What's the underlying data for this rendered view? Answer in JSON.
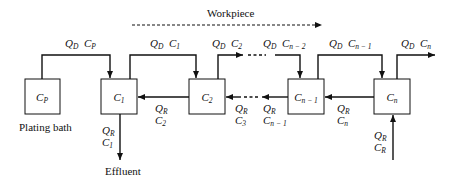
{
  "diagram": {
    "title_arrow": {
      "label": "Workpiece",
      "style": "dashed",
      "direction": "right"
    },
    "tanks": [
      {
        "id": "plating-bath",
        "symbol": "C",
        "sub": "P",
        "caption": "Plating bath"
      },
      {
        "id": "rinse-1",
        "symbol": "C",
        "sub": "1"
      },
      {
        "id": "rinse-2",
        "symbol": "C",
        "sub": "2"
      },
      {
        "id": "rinse-n-1",
        "symbol": "C",
        "sub": "n − 1"
      },
      {
        "id": "rinse-n",
        "symbol": "C",
        "sub": "n"
      }
    ],
    "dragout_flows": [
      {
        "q": "Q",
        "q_sub": "D",
        "c": "C",
        "c_sub": "P"
      },
      {
        "q": "Q",
        "q_sub": "D",
        "c": "C",
        "c_sub": "1"
      },
      {
        "q": "Q",
        "q_sub": "D",
        "c": "C",
        "c_sub": "2"
      },
      {
        "q": "Q",
        "q_sub": "D",
        "c": "C",
        "c_sub": "n − 2"
      },
      {
        "q": "Q",
        "q_sub": "D",
        "c": "C",
        "c_sub": "n − 1"
      },
      {
        "q": "Q",
        "q_sub": "D",
        "c": "C",
        "c_sub": "n"
      }
    ],
    "rinse_flows": [
      {
        "q": "Q",
        "q_sub": "R",
        "c": "C",
        "c_sub": "2"
      },
      {
        "q": "Q",
        "q_sub": "R",
        "c": "C",
        "c_sub": "3"
      },
      {
        "q": "Q",
        "q_sub": "R",
        "c": "C",
        "c_sub": "n − 1"
      },
      {
        "q": "Q",
        "q_sub": "R",
        "c": "C",
        "c_sub": "n"
      }
    ],
    "effluent": {
      "q": "Q",
      "q_sub": "R",
      "c": "C",
      "c_sub": "1",
      "label": "Effluent"
    },
    "fresh_rinse": {
      "q": "Q",
      "q_sub": "R",
      "c": "C",
      "c_sub": "R"
    }
  }
}
